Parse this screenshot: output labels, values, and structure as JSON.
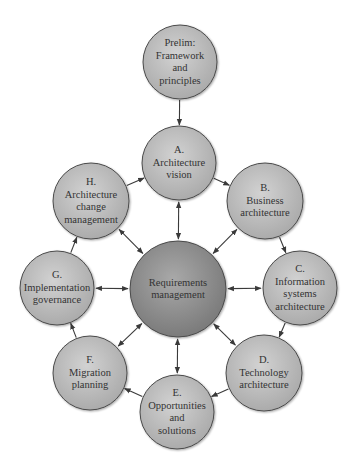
{
  "colors": {
    "satellite_fill_light": "#c9c9c9",
    "satellite_fill_dark": "#a9a9a9",
    "center_fill_light": "#a6a6a6",
    "center_fill_dark": "#7c7c7c",
    "stroke": "#4a4a4a",
    "arrow": "#3a3a3a",
    "text": "#333333"
  },
  "nodes": {
    "prelim": {
      "lines": [
        "Prelim:",
        "Framework",
        "and",
        "principles"
      ],
      "cx": 180,
      "cy": 62,
      "r": 37
    },
    "a": {
      "lines": [
        "A.",
        "Architecture",
        "vision"
      ],
      "cx": 179,
      "cy": 163,
      "r": 37
    },
    "b": {
      "lines": [
        "B.",
        "Business",
        "architecture"
      ],
      "cx": 265,
      "cy": 201,
      "r": 38
    },
    "c": {
      "lines": [
        "C.",
        "Information",
        "systems",
        "architecture"
      ],
      "cx": 300,
      "cy": 288,
      "r": 37
    },
    "d": {
      "lines": [
        "D.",
        "Technology",
        "architecture"
      ],
      "cx": 264,
      "cy": 373,
      "r": 38
    },
    "e": {
      "lines": [
        "E.",
        "Opportunities",
        "and",
        "solutions"
      ],
      "cx": 177,
      "cy": 412,
      "r": 37
    },
    "f": {
      "lines": [
        "F.",
        "Migration",
        "planning"
      ],
      "cx": 90,
      "cy": 373,
      "r": 37
    },
    "g": {
      "lines": [
        "G.",
        "Implementation",
        "governance"
      ],
      "cx": 57,
      "cy": 288,
      "r": 37
    },
    "h": {
      "lines": [
        "H.",
        "Architecture",
        "change",
        "management"
      ],
      "cx": 91,
      "cy": 201,
      "r": 38
    },
    "center": {
      "lines": [
        "Requirements",
        "management"
      ],
      "cx": 178,
      "cy": 289,
      "r": 48
    }
  },
  "edges": {
    "cycle": [
      {
        "from": "prelim",
        "to": "a",
        "type": "one-way"
      },
      {
        "from": "a",
        "to": "b",
        "type": "one-way"
      },
      {
        "from": "b",
        "to": "c",
        "type": "one-way"
      },
      {
        "from": "c",
        "to": "d",
        "type": "one-way"
      },
      {
        "from": "d",
        "to": "e",
        "type": "one-way"
      },
      {
        "from": "e",
        "to": "f",
        "type": "one-way"
      },
      {
        "from": "f",
        "to": "g",
        "type": "one-way"
      },
      {
        "from": "g",
        "to": "h",
        "type": "one-way"
      },
      {
        "from": "h",
        "to": "a",
        "type": "one-way"
      }
    ],
    "hub": [
      {
        "from": "center",
        "to": "a",
        "type": "two-way"
      },
      {
        "from": "center",
        "to": "b",
        "type": "two-way"
      },
      {
        "from": "center",
        "to": "c",
        "type": "two-way"
      },
      {
        "from": "center",
        "to": "d",
        "type": "two-way"
      },
      {
        "from": "center",
        "to": "e",
        "type": "two-way"
      },
      {
        "from": "center",
        "to": "f",
        "type": "two-way"
      },
      {
        "from": "center",
        "to": "g",
        "type": "two-way"
      },
      {
        "from": "center",
        "to": "h",
        "type": "two-way"
      }
    ]
  }
}
